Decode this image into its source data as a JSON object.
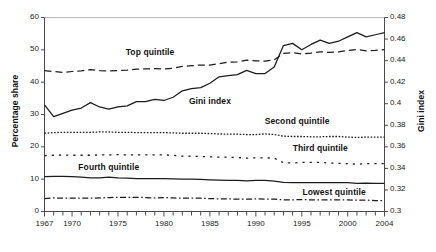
{
  "chart_data": {
    "type": "line",
    "title": "",
    "subtitle": "",
    "xlabel": "",
    "ylabel": "Percentage share",
    "ylabel_right": "Gini index",
    "xlim": [
      1967,
      2004
    ],
    "ylim": [
      0,
      60
    ],
    "ylim_right": [
      0.3,
      0.48
    ],
    "grid": false,
    "legend_position": "inline-annotations",
    "x_ticks_major": [
      "1967",
      "1970",
      "1975",
      "1980",
      "1985",
      "1990",
      "1995",
      "2000",
      "2004"
    ],
    "x_tick_values_major": [
      1967,
      1970,
      1975,
      1980,
      1985,
      1990,
      1995,
      2000,
      2004
    ],
    "x_tick_minor_step": 1,
    "y_ticks_left": [
      "0",
      "10",
      "20",
      "30",
      "40",
      "50",
      "60"
    ],
    "y_tick_values_left": [
      0,
      10,
      20,
      30,
      40,
      50,
      60
    ],
    "y_ticks_right": [
      "0.3",
      "0.32",
      "0.34",
      "0.36",
      "0.38",
      "0.4",
      "0.42",
      "0.44",
      "0.46",
      "0.48"
    ],
    "y_tick_values_right": [
      0.3,
      0.32,
      0.34,
      0.36,
      0.38,
      0.4,
      0.42,
      0.44,
      0.46,
      0.48
    ],
    "x": [
      1967,
      1968,
      1969,
      1970,
      1971,
      1972,
      1973,
      1974,
      1975,
      1976,
      1977,
      1978,
      1979,
      1980,
      1981,
      1982,
      1983,
      1984,
      1985,
      1986,
      1987,
      1988,
      1989,
      1990,
      1991,
      1992,
      1993,
      1994,
      1995,
      1996,
      1997,
      1998,
      1999,
      2000,
      2001,
      2002,
      2003,
      2004
    ],
    "series": [
      {
        "name": "Top quintile",
        "axis": "left",
        "style": "dashed",
        "label_x": 1978.5,
        "label_y": 49.0,
        "values": [
          43.6,
          43.3,
          43.0,
          43.3,
          43.5,
          43.9,
          43.6,
          43.5,
          43.6,
          43.7,
          44.0,
          44.1,
          44.2,
          44.1,
          44.3,
          44.9,
          45.1,
          45.3,
          45.3,
          45.7,
          46.2,
          46.3,
          46.8,
          46.6,
          46.5,
          46.9,
          48.9,
          49.1,
          48.7,
          49.0,
          49.4,
          49.2,
          49.4,
          49.8,
          50.1,
          49.7,
          49.8,
          50.1
        ]
      },
      {
        "name": "Gini index",
        "axis": "right",
        "style": "solid",
        "label_x": 1985.0,
        "label_y": 34.0,
        "values": [
          0.399,
          0.388,
          0.391,
          0.394,
          0.396,
          0.401,
          0.397,
          0.395,
          0.397,
          0.398,
          0.402,
          0.402,
          0.404,
          0.403,
          0.406,
          0.412,
          0.414,
          0.415,
          0.419,
          0.425,
          0.426,
          0.427,
          0.431,
          0.428,
          0.428,
          0.434,
          0.454,
          0.456,
          0.45,
          0.455,
          0.459,
          0.456,
          0.458,
          0.462,
          0.466,
          0.462,
          0.464,
          0.466
        ]
      },
      {
        "name": "Second quintile",
        "axis": "left",
        "style": "fine-dotted",
        "label_x": 1994.5,
        "label_y": 27.8,
        "values": [
          24.2,
          24.4,
          24.5,
          24.5,
          24.5,
          24.5,
          24.6,
          24.6,
          24.5,
          24.5,
          24.4,
          24.4,
          24.4,
          24.4,
          24.3,
          24.2,
          24.2,
          24.2,
          24.1,
          24.0,
          23.9,
          23.9,
          23.8,
          23.8,
          24.0,
          23.8,
          23.3,
          23.2,
          23.2,
          23.1,
          23.1,
          23.2,
          23.2,
          23.0,
          22.9,
          23.0,
          23.0,
          23.0
        ]
      },
      {
        "name": "Third quintile",
        "axis": "left",
        "style": "dotted",
        "label_x": 1997.0,
        "label_y": 19.2,
        "values": [
          17.3,
          17.4,
          17.5,
          17.4,
          17.4,
          17.4,
          17.5,
          17.5,
          17.6,
          17.5,
          17.5,
          17.5,
          17.5,
          17.5,
          17.4,
          17.1,
          17.1,
          17.0,
          16.9,
          16.8,
          16.8,
          16.7,
          16.5,
          16.6,
          16.6,
          16.5,
          15.1,
          15.0,
          15.2,
          15.2,
          15.2,
          15.0,
          14.9,
          14.8,
          14.6,
          14.8,
          14.8,
          14.8
        ]
      },
      {
        "name": "Fourth quintile",
        "axis": "left",
        "style": "solid",
        "label_x": 1974.0,
        "label_y": 13.3,
        "values": [
          10.8,
          10.9,
          10.9,
          10.8,
          10.6,
          10.4,
          10.4,
          10.6,
          10.4,
          10.3,
          10.2,
          10.2,
          10.2,
          10.2,
          10.1,
          10.0,
          10.0,
          9.9,
          9.8,
          9.7,
          9.6,
          9.6,
          9.5,
          9.6,
          9.6,
          9.4,
          9.0,
          8.9,
          8.9,
          8.9,
          8.9,
          8.9,
          8.9,
          8.9,
          8.7,
          8.8,
          8.7,
          8.7
        ]
      },
      {
        "name": "Lowest quintile",
        "axis": "left",
        "style": "dash-dot",
        "label_x": 1998.5,
        "label_y": 5.7,
        "values": [
          4.0,
          4.2,
          4.1,
          4.1,
          4.1,
          4.1,
          4.2,
          4.3,
          4.4,
          4.4,
          4.4,
          4.3,
          4.2,
          4.3,
          4.2,
          4.1,
          4.1,
          4.1,
          4.0,
          3.9,
          3.9,
          3.8,
          3.8,
          3.9,
          3.8,
          3.8,
          3.6,
          3.6,
          3.7,
          3.6,
          3.6,
          3.6,
          3.6,
          3.6,
          3.5,
          3.5,
          3.4,
          3.4
        ]
      }
    ]
  }
}
